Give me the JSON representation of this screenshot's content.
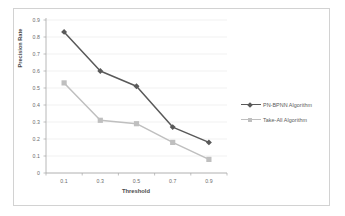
{
  "chart_data": {
    "type": "line",
    "title": "",
    "xlabel": "Threshold",
    "ylabel": "Precision Rate",
    "categories": [
      "0.1",
      "0.3",
      "0.5",
      "0.7",
      "0.9"
    ],
    "ylim": [
      0,
      0.9
    ],
    "ytick_labels": [
      "0.9",
      "0.8",
      "0.7",
      "0.6",
      "0.5",
      "0.4",
      "0.3",
      "0.2",
      "0.1",
      "0"
    ],
    "ytick_values": [
      0.9,
      0.8,
      0.7,
      0.6,
      0.5,
      0.4,
      0.3,
      0.2,
      0.1,
      0
    ],
    "grid": true,
    "grid_axis": "y",
    "legend_position": "right",
    "series": [
      {
        "name": "PN-BPNN Algorithm",
        "values": [
          0.83,
          0.6,
          0.51,
          0.27,
          0.18
        ],
        "color": "#595959",
        "marker": "diamond"
      },
      {
        "name": "Take-All Algorithm",
        "values": [
          0.53,
          0.31,
          0.29,
          0.18,
          0.08
        ],
        "color": "#bfbfbf",
        "marker": "square"
      }
    ]
  },
  "axes": {
    "y_title": "Precision Rate",
    "x_title": "Threshold",
    "y_ticks": [
      "0.9",
      "0.8",
      "0.7",
      "0.6",
      "0.5",
      "0.4",
      "0.3",
      "0.2",
      "0.1",
      "0"
    ],
    "x_ticks": [
      "0.1",
      "0.3",
      "0.5",
      "0.7",
      "0.9"
    ]
  },
  "legend": {
    "items": [
      {
        "label": "PN-BPNN Algorithm",
        "color": "#595959",
        "marker": "diamond"
      },
      {
        "label": "Take-All Algorithm",
        "color": "#bfbfbf",
        "marker": "square"
      }
    ]
  },
  "style": {
    "background": "#ffffff",
    "border_color": "#d2d2d2",
    "grid_color": "#e8e8e8",
    "axis_color": "#a6a6a6",
    "tick_text_color": "#6b6b6b",
    "title_text_color": "#4a4a4a"
  }
}
